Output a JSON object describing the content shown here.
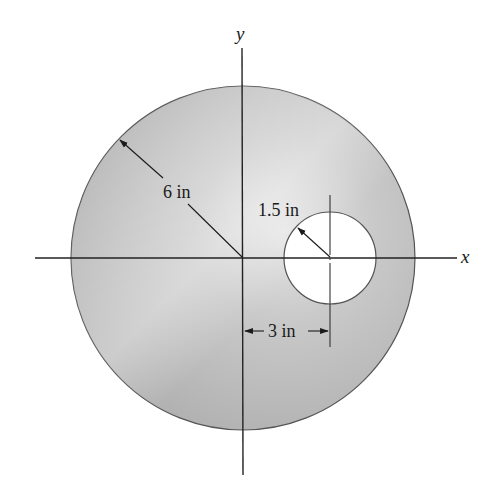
{
  "diagram": {
    "axes": {
      "x_label": "x",
      "y_label": "y"
    },
    "outer_circle": {
      "radius_label": "6 in",
      "fill_color": "#b8b8b8"
    },
    "hole": {
      "radius_label": "1.5 in",
      "fill_color": "#ffffff"
    },
    "offset_dimension": {
      "label": "3 in"
    }
  }
}
